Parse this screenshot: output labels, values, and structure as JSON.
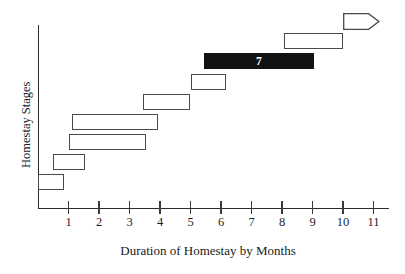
{
  "chart_data": {
    "type": "bar",
    "title": "",
    "subtitle": "",
    "xlabel": "Duration of Homestay by Months",
    "ylabel": "Homestay Stages",
    "orientation": "horizontal",
    "style": "gantt",
    "grid": false,
    "legend": false,
    "xlim": [
      0,
      11.6
    ],
    "xticks": [
      1,
      2,
      3,
      4,
      5,
      6,
      7,
      8,
      9,
      10,
      11
    ],
    "xtick_labels": [
      "1",
      "2",
      "3",
      "4",
      "5",
      "6",
      "7",
      "8",
      "9",
      "10",
      "11"
    ],
    "ylim": [
      0,
      9
    ],
    "yticks": [],
    "ytick_labels": [],
    "bars": [
      {
        "stage": 1,
        "start": 0.0,
        "end": 0.85,
        "label": "",
        "highlight": false,
        "shape": "rect"
      },
      {
        "stage": 2,
        "start": 0.5,
        "end": 1.55,
        "label": "",
        "highlight": false,
        "shape": "rect"
      },
      {
        "stage": 3,
        "start": 1.0,
        "end": 3.55,
        "label": "",
        "highlight": false,
        "shape": "rect"
      },
      {
        "stage": 4,
        "start": 1.1,
        "end": 3.95,
        "label": "",
        "highlight": false,
        "shape": "rect"
      },
      {
        "stage": 5,
        "start": 3.45,
        "end": 5.0,
        "label": "",
        "highlight": false,
        "shape": "rect"
      },
      {
        "stage": 6,
        "start": 5.0,
        "end": 6.15,
        "label": "",
        "highlight": false,
        "shape": "rect"
      },
      {
        "stage": 7,
        "start": 5.45,
        "end": 9.05,
        "label": "7",
        "highlight": true,
        "shape": "rect"
      },
      {
        "stage": 8,
        "start": 8.05,
        "end": 10.0,
        "label": "",
        "highlight": false,
        "shape": "rect"
      },
      {
        "stage": 9,
        "start": 10.0,
        "end": 11.2,
        "label": "",
        "highlight": false,
        "shape": "arrow"
      }
    ],
    "colors": {
      "axis": "#2b2b2b",
      "bar_outline": "#4a4a4a",
      "bar_fill": "#ffffff",
      "highlight_fill": "#121212",
      "highlight_text": "#ffffff",
      "background": "#ffffff",
      "text": "#1a1a1a"
    }
  }
}
